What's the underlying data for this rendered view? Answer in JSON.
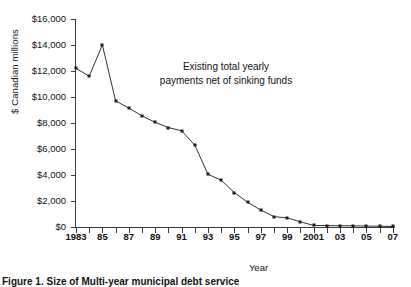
{
  "chart_data": {
    "type": "line",
    "title": "",
    "xlabel": "Year",
    "ylabel": "$ Canadian millions",
    "ylim": [
      0,
      16000
    ],
    "ytick_labels": [
      "$0",
      "$2,000",
      "$4,000",
      "$6,000",
      "$8,000",
      "$10,000",
      "$12,000",
      "$14,000",
      "$16,000"
    ],
    "ytick_values": [
      0,
      2000,
      4000,
      6000,
      8000,
      10000,
      12000,
      14000,
      16000
    ],
    "xlim": [
      1983,
      2007
    ],
    "xtick_labels": [
      "1983",
      "85",
      "87",
      "89",
      "91",
      "93",
      "95",
      "97",
      "99",
      "2001",
      "03",
      "05",
      "07"
    ],
    "xtick_values": [
      1983,
      1985,
      1987,
      1989,
      1991,
      1993,
      1995,
      1997,
      1999,
      2001,
      2003,
      2005,
      2007
    ],
    "grid": false,
    "legend": "none",
    "annotations": [
      {
        "text_line1": "Existing total yearly",
        "text_line2": "payments net of sinking funds"
      }
    ],
    "series": [
      {
        "name": "Existing total yearly payments net of sinking funds",
        "marker": "square",
        "color": "#1c1c1c",
        "x": [
          1983,
          1984,
          1985,
          1986,
          1987,
          1988,
          1989,
          1990,
          1991,
          1992,
          1993,
          1994,
          1995,
          1996,
          1997,
          1998,
          1999,
          2000,
          2001,
          2002,
          2003,
          2004,
          2005,
          2006,
          2007
        ],
        "values": [
          12200,
          11600,
          14000,
          9700,
          9150,
          8550,
          8050,
          7650,
          7400,
          6300,
          4050,
          3600,
          2650,
          1900,
          1300,
          800,
          700,
          400,
          120,
          110,
          100,
          90,
          70,
          60,
          40
        ]
      }
    ]
  },
  "axes": {
    "y_title": "$ Canadian millions",
    "x_title": "Year"
  },
  "caption": {
    "label": "Figure 1.",
    "text": "Size of Multi-year municipal debt service"
  }
}
